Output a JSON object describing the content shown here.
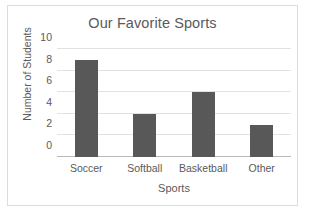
{
  "chart_data": {
    "type": "bar",
    "title": "Our Favorite Sports",
    "xlabel": "Sports",
    "ylabel": "Number of Students",
    "categories": [
      "Soccer",
      "Softball",
      "Basketball",
      "Other"
    ],
    "values": [
      9,
      4,
      6,
      3
    ],
    "yticks": [
      0,
      2,
      4,
      6,
      8,
      10
    ],
    "ylim": [
      0,
      10
    ],
    "grid": true,
    "legend": false,
    "bar_color": "#585858",
    "gridline_color": "#e2e2e2",
    "axis_color": "#b9b9b9",
    "text_color": "#5a5a5a",
    "frame_color": "#dcdcdc",
    "background": "#ffffff"
  }
}
